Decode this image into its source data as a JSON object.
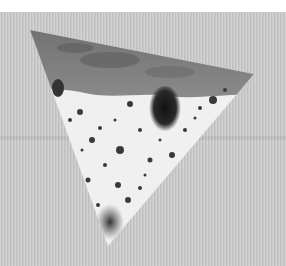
{
  "image": {
    "description": "Grayscale photograph of a triangular specimen with porous, spotted texture on a striped gray background",
    "colors": {
      "background": "#c9c9c9",
      "top_margin": "#ffffff",
      "specimen_light": "#f2f2f2",
      "specimen_dark": "#2a2a2a",
      "crust": "#7a7a7a"
    },
    "specimen": {
      "shape": "triangle",
      "vertices": [
        [
          30,
          30
        ],
        [
          254,
          74
        ],
        [
          108,
          246
        ]
      ]
    }
  }
}
